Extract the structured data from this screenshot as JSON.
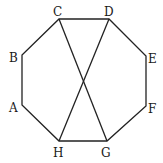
{
  "diagram": {
    "type": "regular octagon with two diagonals",
    "vertices": [
      {
        "name": "A",
        "x": 22,
        "y": 105,
        "label_x": 9,
        "label_y": 112
      },
      {
        "name": "B",
        "x": 22,
        "y": 55,
        "label_x": 9,
        "label_y": 62
      },
      {
        "name": "C",
        "x": 59,
        "y": 19,
        "label_x": 53,
        "label_y": 16
      },
      {
        "name": "D",
        "x": 109,
        "y": 19,
        "label_x": 104,
        "label_y": 16
      },
      {
        "name": "E",
        "x": 146,
        "y": 56,
        "label_x": 148,
        "label_y": 63
      },
      {
        "name": "F",
        "x": 146,
        "y": 106,
        "label_x": 148,
        "label_y": 113
      },
      {
        "name": "G",
        "x": 107,
        "y": 141,
        "label_x": 101,
        "label_y": 157
      },
      {
        "name": "H",
        "x": 59,
        "y": 141,
        "label_x": 53,
        "label_y": 157
      }
    ],
    "diagonals": [
      {
        "from": "C",
        "to": "G"
      },
      {
        "from": "D",
        "to": "H"
      }
    ],
    "stroke_color": "#222222"
  }
}
